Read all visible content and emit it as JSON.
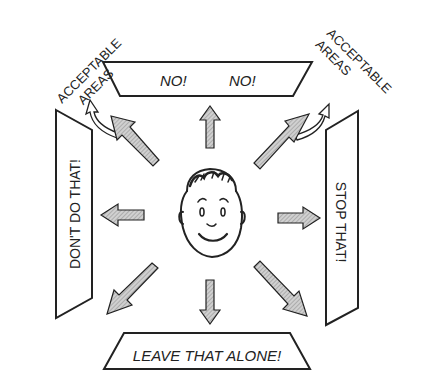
{
  "diagram": {
    "center": {
      "figure": "smiling-boy-face"
    },
    "top_sign": {
      "words": [
        "NO!",
        "NO!"
      ]
    },
    "left_sign": {
      "text": "DON'T DO THAT!"
    },
    "right_sign": {
      "text": "STOP THAT!"
    },
    "bottom_sign": {
      "text": "LEAVE THAT ALONE!"
    },
    "acceptable_left": {
      "line1": "ACCEPTABLE",
      "line2": "AREAS"
    },
    "acceptable_right": {
      "line1": "ACCEPTABLE",
      "line2": "AREAS"
    },
    "colors": {
      "stroke": "#222222",
      "arrow_fill": "#b8b8b8",
      "background": "#ffffff"
    }
  }
}
